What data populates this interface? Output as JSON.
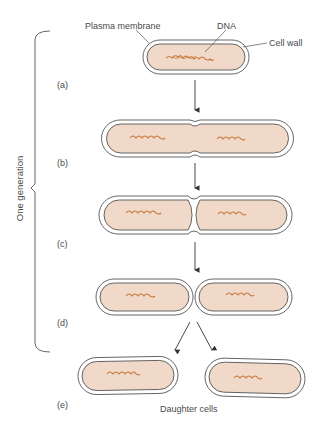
{
  "labels": {
    "plasma_membrane": "Plasma membrane",
    "dna": "DNA",
    "cell_wall": "Cell wall",
    "one_generation": "One generation",
    "daughter_cells": "Daughter cells"
  },
  "steps": [
    {
      "id": "a",
      "label": "(a)"
    },
    {
      "id": "b",
      "label": "(b)"
    },
    {
      "id": "c",
      "label": "(c)"
    },
    {
      "id": "d",
      "label": "(d)"
    },
    {
      "id": "e",
      "label": "(e)"
    }
  ],
  "colors": {
    "cytoplasm": "#f0d9c8",
    "wall": "#ffffff",
    "outline": "#555555",
    "dna": "#c8783c",
    "text": "#4a4a4a"
  }
}
